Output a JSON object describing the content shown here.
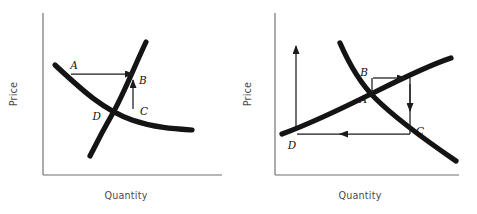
{
  "figure": {
    "type": "diagram",
    "background_color": "#ffffff",
    "curve_color": "#141414",
    "axis_color": "#6e6e6e",
    "annotation_color": "#1b1b1b"
  },
  "panels": [
    {
      "id": "left-panel",
      "name": "left-diagram",
      "axes": {
        "y_label": "Price",
        "x_label": "Quantity",
        "y_axis": {
          "x": 43,
          "y_top": 13,
          "y_bottom": 175
        },
        "x_axis": {
          "y": 175,
          "x_left": 43,
          "x_right": 222
        }
      },
      "curves": [
        {
          "name": "demand-curve",
          "direction": "downward-sloping",
          "start": [
            55,
            65
          ],
          "end": [
            192,
            130
          ]
        },
        {
          "name": "supply-curve",
          "direction": "upward-sloping",
          "start": [
            90,
            156
          ],
          "end": [
            146,
            42
          ]
        }
      ],
      "points": [
        {
          "label": "A",
          "x": 74,
          "y": 69
        },
        {
          "label": "B",
          "x": 139,
          "y": 81
        },
        {
          "label": "C",
          "x": 140,
          "y": 112
        },
        {
          "label": "D",
          "x": 101,
          "y": 120
        }
      ],
      "arrows": [
        {
          "name": "arrow-a-to-b",
          "from": [
            71,
            74
          ],
          "to": [
            133,
            74
          ],
          "direction": "right"
        },
        {
          "name": "arrow-c-to-b",
          "from": [
            133,
            109
          ],
          "to": [
            133,
            80
          ],
          "direction": "up"
        }
      ]
    },
    {
      "id": "right-panel",
      "name": "right-diagram",
      "axes": {
        "y_label": "Price",
        "x_label": "Quantity",
        "y_axis": {
          "x": 38,
          "y_top": 13,
          "y_bottom": 175
        },
        "x_axis": {
          "y": 175,
          "x_left": 38,
          "x_right": 222
        }
      },
      "curves": [
        {
          "name": "supply-curve",
          "direction": "upward-sloping",
          "start": [
            45,
            134
          ],
          "end": [
            214,
            58
          ]
        },
        {
          "name": "demand-curve",
          "direction": "downward-sloping",
          "start": [
            103,
            43
          ],
          "end": [
            219,
            161
          ]
        }
      ],
      "points": [
        {
          "label": "A",
          "x": 120,
          "y": 100
        },
        {
          "label": "B",
          "x": 131,
          "y": 75
        },
        {
          "label": "C",
          "x": 178,
          "y": 131
        },
        {
          "label": "D",
          "x": 55,
          "y": 147
        }
      ],
      "arrows": [
        {
          "name": "arrow-price-rise",
          "from": [
            59,
            131
          ],
          "to": [
            59,
            46
          ],
          "direction": "up"
        },
        {
          "name": "arrow-b-to-right",
          "from": [
            136,
            78
          ],
          "to": [
            173,
            78
          ],
          "direction": "right"
        },
        {
          "name": "arrow-down-to-c",
          "from": [
            173,
            80
          ],
          "to": [
            173,
            113
          ],
          "direction": "down"
        },
        {
          "name": "arrow-c-to-d",
          "from": [
            173,
            134
          ],
          "to": [
            63,
            134
          ],
          "direction": "left"
        }
      ],
      "connectors": [
        {
          "name": "connector-a-to-b",
          "from": [
            135,
            93
          ],
          "to": [
            135,
            78
          ]
        },
        {
          "name": "connector-c-vertical",
          "from": [
            173,
            78
          ],
          "to": [
            173,
            134
          ]
        }
      ]
    }
  ],
  "labels": {
    "price": "Price",
    "quantity": "Quantity",
    "a": "A",
    "b": "B",
    "c": "C",
    "d": "D"
  }
}
